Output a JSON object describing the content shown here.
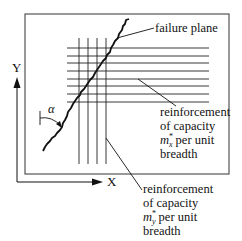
{
  "diagram": {
    "axes": {
      "x_label": "X",
      "y_label": "Y"
    },
    "angle_label": "α",
    "failure_plane": {
      "label": "failure plane"
    },
    "reinforcement_x": {
      "lines": [
        "reinforcement",
        "of capacity",
        "per unit",
        "breadth"
      ],
      "symbol": "m",
      "symbol_sub": "x",
      "symbol_sup": "*"
    },
    "reinforcement_y": {
      "lines": [
        "reinforcement",
        "of capacity",
        "per unit",
        "breadth"
      ],
      "symbol": "m",
      "symbol_sub": "y",
      "symbol_sup": "*"
    },
    "colors": {
      "stroke": "#111111",
      "background": "#ffffff"
    }
  }
}
